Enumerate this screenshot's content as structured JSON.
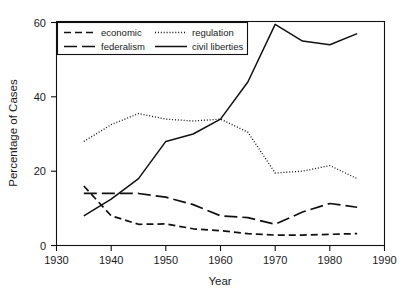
{
  "chart_data": {
    "type": "line",
    "title": "",
    "xlabel": "Year",
    "ylabel": "Percentage of Cases",
    "xlim": [
      1930,
      1990
    ],
    "ylim": [
      0,
      60
    ],
    "xticks": [
      1930,
      1940,
      1950,
      1960,
      1970,
      1980,
      1990
    ],
    "yticks": [
      0,
      20,
      40,
      60
    ],
    "grid": false,
    "legend_position": "top-left-inside",
    "x": [
      1935,
      1940,
      1945,
      1950,
      1955,
      1960,
      1965,
      1970,
      1975,
      1980,
      1985
    ],
    "series": [
      {
        "name": "economic",
        "style": "short-dashed",
        "values": [
          16,
          8,
          5.7,
          5.8,
          4.5,
          4,
          3.2,
          2.8,
          2.8,
          3,
          3.2
        ]
      },
      {
        "name": "regulation",
        "style": "dotted",
        "values": [
          28,
          32.5,
          35.5,
          34,
          33.5,
          34,
          30.5,
          19.5,
          20,
          21.5,
          18
        ]
      },
      {
        "name": "federalism",
        "style": "long-dashed",
        "values": [
          14,
          14,
          14,
          13,
          11,
          8,
          7.5,
          5.7,
          9,
          11.3,
          10.3
        ]
      },
      {
        "name": "civil liberties",
        "style": "solid",
        "values": [
          8,
          12.5,
          18,
          28,
          30,
          34,
          44,
          59.5,
          55,
          54,
          57
        ]
      }
    ]
  },
  "axes": {
    "x_tick_labels": [
      "1930",
      "1940",
      "1950",
      "1960",
      "1970",
      "1980",
      "1990"
    ],
    "y_tick_labels": [
      "0",
      "20",
      "40",
      "60"
    ],
    "x_axis_title": "Year",
    "y_axis_title": "Percentage of Cases"
  },
  "legend": {
    "entries": [
      {
        "label": "economic",
        "style": "short-dashed"
      },
      {
        "label": "regulation",
        "style": "dotted"
      },
      {
        "label": "federalism",
        "style": "long-dashed"
      },
      {
        "label": "civil liberties",
        "style": "solid"
      }
    ]
  },
  "colors": {
    "line": "#111111",
    "text": "#1a1a1a",
    "background": "#ffffff"
  }
}
